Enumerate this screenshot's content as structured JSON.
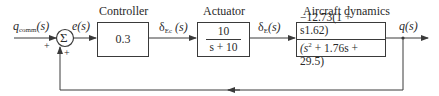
{
  "diagram": {
    "type": "block-diagram",
    "input": {
      "symbol": "q",
      "subscript": "comm",
      "arg": "(s)"
    },
    "summing_junction": {
      "glyph": "Σ",
      "signs": [
        "+",
        "+"
      ]
    },
    "error": {
      "label": "e(s)"
    },
    "blocks": [
      {
        "id": "controller",
        "title": "Controller",
        "content": "0.3"
      },
      {
        "id": "actuator",
        "title": "Actuator",
        "numerator": "10",
        "denominator": "s + 10"
      },
      {
        "id": "aircraft",
        "title": "Aircraft dynamics",
        "numerator": "−12.73(1 + s1.62)",
        "denominator_prefix": "(s",
        "denominator_power": "2",
        "denominator_suffix": " + 1.76s + 29.5)"
      }
    ],
    "signals": {
      "controller_out": {
        "symbol": "δ",
        "subscript": "Ec",
        "arg": " (s)"
      },
      "actuator_out": {
        "symbol": "δ",
        "subscript": "E",
        "arg": "(s)"
      },
      "output": {
        "label": "q(s)"
      }
    },
    "feedback": {
      "type": "unity",
      "sign": "+"
    }
  }
}
